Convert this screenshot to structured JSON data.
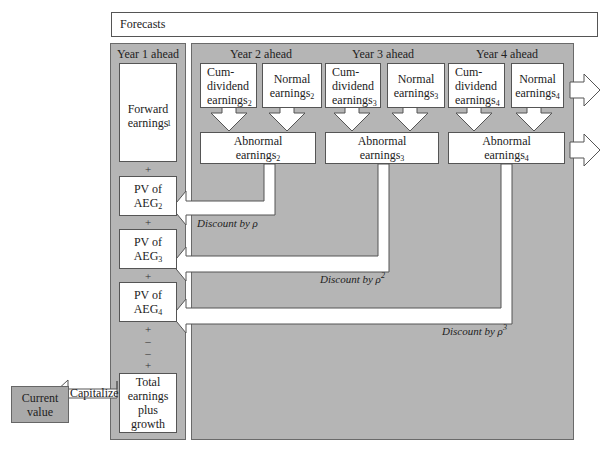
{
  "forecasts_label": "Forecasts",
  "year1": {
    "header": "Year 1 ahead",
    "forward_earnings": {
      "text": "Forward earnings",
      "sub": "1"
    },
    "pv_boxes": [
      {
        "line1": "PV of",
        "line2": "AEG",
        "sub": "2"
      },
      {
        "line1": "PV of",
        "line2": "AEG",
        "sub": "3"
      },
      {
        "line1": "PV of",
        "line2": "AEG",
        "sub": "4"
      }
    ],
    "operators": [
      "+",
      "+",
      "+",
      "+",
      "–",
      "–",
      "+"
    ],
    "total": "Total earnings plus growth"
  },
  "years": [
    {
      "header": "Year 2 ahead",
      "cum": {
        "l1": "Cum-",
        "l2": "dividend",
        "l3": "earnings",
        "sub": "2"
      },
      "normal": {
        "l1": "Normal",
        "l2": "earnings",
        "sub": "2"
      },
      "abnormal": {
        "l1": "Abnormal",
        "l2": "earnings",
        "sub": "2"
      }
    },
    {
      "header": "Year 3 ahead",
      "cum": {
        "l1": "Cum-",
        "l2": "dividend",
        "l3": "earnings",
        "sub": "3"
      },
      "normal": {
        "l1": "Normal",
        "l2": "earnings",
        "sub": "3"
      },
      "abnormal": {
        "l1": "Abnormal",
        "l2": "earnings",
        "sub": "3"
      }
    },
    {
      "header": "Year 4 ahead",
      "cum": {
        "l1": "Cum-",
        "l2": "dividend",
        "l3": "earnings",
        "sub": "4"
      },
      "normal": {
        "l1": "Normal",
        "l2": "earnings",
        "sub": "4"
      },
      "abnormal": {
        "l1": "Abnormal",
        "l2": "earnings",
        "sub": "4"
      }
    }
  ],
  "discounts": [
    {
      "text": "Discount by ",
      "symbol": "ρ",
      "power": ""
    },
    {
      "text": "Discount by ",
      "symbol": "ρ",
      "power": "2"
    },
    {
      "text": "Discount by ",
      "symbol": "ρ",
      "power": "3"
    }
  ],
  "capitalize_label": "Capitalize",
  "current_value": "Current value",
  "colors": {
    "panel": "#b5b5b5",
    "box": "#ffffff",
    "border": "#555555",
    "current_value_fill": "#a9a9a9"
  }
}
